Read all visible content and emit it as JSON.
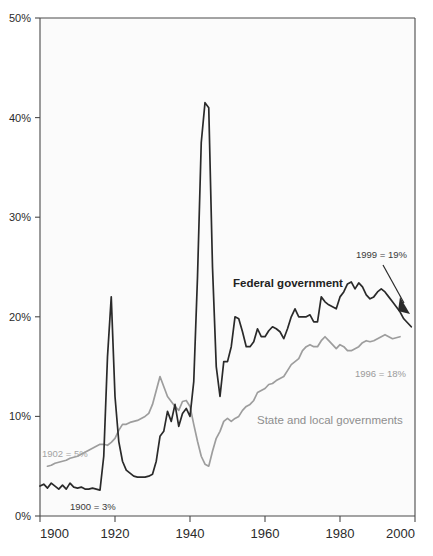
{
  "chart_data": {
    "type": "line",
    "title": "",
    "subtitle": "",
    "xlabel": "",
    "ylabel": "",
    "xlim": [
      1900,
      2000
    ],
    "ylim": [
      0,
      50
    ],
    "xticks": [
      1900,
      1920,
      1940,
      1960,
      1980,
      2000
    ],
    "xtick_labels": [
      "1900",
      "1920",
      "1940",
      "1960",
      "1980",
      "2000"
    ],
    "yticks": [
      0,
      10,
      20,
      30,
      40,
      50
    ],
    "ytick_labels": [
      "0%",
      "10%",
      "20%",
      "30%",
      "40%",
      "50%"
    ],
    "grid": false,
    "legend_position": "inline-labels",
    "series": [
      {
        "name": "Federal government",
        "color": "#2a2a2a",
        "label_position": "inline",
        "x": [
          1900,
          1901,
          1902,
          1903,
          1904,
          1905,
          1906,
          1907,
          1908,
          1909,
          1910,
          1911,
          1912,
          1913,
          1914,
          1915,
          1916,
          1917,
          1918,
          1919,
          1920,
          1921,
          1922,
          1923,
          1924,
          1925,
          1926,
          1927,
          1928,
          1929,
          1930,
          1931,
          1932,
          1933,
          1934,
          1935,
          1936,
          1937,
          1938,
          1939,
          1940,
          1941,
          1942,
          1943,
          1944,
          1945,
          1946,
          1947,
          1948,
          1949,
          1950,
          1951,
          1952,
          1953,
          1954,
          1955,
          1956,
          1957,
          1958,
          1959,
          1960,
          1961,
          1962,
          1963,
          1964,
          1965,
          1966,
          1967,
          1968,
          1969,
          1970,
          1971,
          1972,
          1973,
          1974,
          1975,
          1976,
          1977,
          1978,
          1979,
          1980,
          1981,
          1982,
          1983,
          1984,
          1985,
          1986,
          1987,
          1988,
          1989,
          1990,
          1991,
          1992,
          1993,
          1994,
          1995,
          1996,
          1997,
          1998,
          1999
        ],
        "values": [
          3.0,
          3.2,
          2.8,
          3.3,
          3.0,
          2.7,
          3.1,
          2.7,
          3.3,
          2.9,
          2.8,
          2.9,
          2.7,
          2.7,
          2.8,
          2.7,
          2.6,
          6.0,
          16.0,
          22.0,
          12.0,
          7.5,
          5.5,
          4.6,
          4.3,
          4.0,
          3.9,
          3.9,
          3.9,
          4.0,
          4.2,
          5.5,
          8.0,
          8.5,
          10.5,
          9.5,
          11.2,
          9.0,
          10.3,
          10.8,
          10.0,
          13.5,
          24.0,
          37.5,
          41.5,
          41.0,
          25.0,
          15.0,
          12.0,
          15.5,
          15.5,
          17.0,
          20.0,
          19.8,
          18.5,
          17.0,
          17.0,
          17.5,
          18.8,
          18.0,
          18.0,
          18.6,
          19.0,
          18.8,
          18.5,
          17.8,
          18.8,
          20.0,
          20.8,
          20.0,
          20.0,
          20.0,
          20.2,
          19.5,
          19.5,
          22.0,
          21.5,
          21.2,
          21.0,
          20.8,
          22.0,
          22.5,
          23.3,
          23.5,
          22.8,
          23.4,
          23.0,
          22.2,
          21.8,
          22.0,
          22.5,
          22.8,
          22.5,
          22.0,
          21.5,
          21.0,
          20.5,
          19.8,
          19.4,
          19.0
        ],
        "annotations": [
          {
            "text": "1900 = 3%",
            "x": 1900,
            "y": 3.0
          },
          {
            "text": "1999 = 19%",
            "x": 1999,
            "y": 19.0
          }
        ]
      },
      {
        "name": "State and local governments",
        "color": "#9d9d9d",
        "label_position": "inline",
        "x": [
          1902,
          1903,
          1904,
          1905,
          1906,
          1907,
          1908,
          1909,
          1910,
          1911,
          1912,
          1913,
          1914,
          1915,
          1916,
          1917,
          1918,
          1919,
          1920,
          1921,
          1922,
          1923,
          1924,
          1925,
          1926,
          1927,
          1928,
          1929,
          1930,
          1931,
          1932,
          1933,
          1934,
          1935,
          1936,
          1937,
          1938,
          1939,
          1940,
          1941,
          1942,
          1943,
          1944,
          1945,
          1946,
          1947,
          1948,
          1949,
          1950,
          1951,
          1952,
          1953,
          1954,
          1955,
          1956,
          1957,
          1958,
          1959,
          1960,
          1961,
          1962,
          1963,
          1964,
          1965,
          1966,
          1967,
          1968,
          1969,
          1970,
          1971,
          1972,
          1973,
          1974,
          1975,
          1976,
          1977,
          1978,
          1979,
          1980,
          1981,
          1982,
          1983,
          1984,
          1985,
          1986,
          1987,
          1988,
          1989,
          1990,
          1991,
          1992,
          1993,
          1994,
          1995,
          1996
        ],
        "values": [
          5.0,
          5.1,
          5.3,
          5.4,
          5.5,
          5.6,
          5.8,
          5.9,
          6.0,
          6.2,
          6.4,
          6.6,
          6.8,
          7.0,
          7.2,
          7.2,
          7.1,
          7.4,
          7.8,
          8.6,
          9.2,
          9.2,
          9.4,
          9.5,
          9.6,
          9.8,
          10.0,
          10.3,
          11.2,
          12.6,
          14.0,
          13.0,
          12.0,
          11.5,
          11.0,
          10.6,
          11.5,
          11.6,
          11.0,
          9.2,
          7.5,
          6.0,
          5.2,
          5.0,
          6.5,
          7.8,
          8.5,
          9.5,
          9.8,
          9.5,
          9.8,
          10.0,
          10.6,
          11.0,
          11.2,
          11.6,
          12.4,
          12.6,
          12.8,
          13.2,
          13.3,
          13.6,
          13.8,
          14.0,
          14.6,
          15.2,
          15.5,
          15.8,
          16.6,
          17.0,
          17.2,
          17.0,
          17.0,
          17.6,
          18.0,
          17.6,
          17.2,
          16.8,
          17.2,
          17.0,
          16.6,
          16.6,
          16.8,
          17.0,
          17.4,
          17.6,
          17.5,
          17.6,
          17.8,
          18.0,
          18.2,
          18.0,
          17.8,
          17.9,
          18.0
        ],
        "annotations": [
          {
            "text": "1902 = 5%",
            "x": 1902,
            "y": 5.0
          },
          {
            "text": "1996 = 18%",
            "x": 1996,
            "y": 18.0
          }
        ]
      }
    ],
    "labels": {
      "federal_series_label": "Federal government",
      "state_series_label": "State and local governments",
      "anno_1900": "1900 = 3%",
      "anno_1902": "1902 = 5%",
      "anno_1999": "1999 = 19%",
      "anno_1996": "1996 = 18%"
    },
    "colors": {
      "federal": "#2a2a2a",
      "state": "#9d9d9d",
      "axis": "#4a4a4a",
      "plot_background": "#fbfbfb",
      "page_background": "#ffffff"
    }
  }
}
